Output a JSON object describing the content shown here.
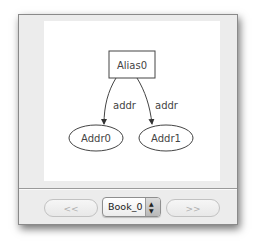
{
  "graph": {
    "nodes": [
      {
        "id": "Alias0",
        "label": "Alias0",
        "shape": "box"
      },
      {
        "id": "Addr0",
        "label": "Addr0",
        "shape": "ellipse"
      },
      {
        "id": "Addr1",
        "label": "Addr1",
        "shape": "ellipse"
      }
    ],
    "edges": [
      {
        "from": "Alias0",
        "to": "Addr0",
        "label": "addr"
      },
      {
        "from": "Alias0",
        "to": "Addr1",
        "label": "addr"
      }
    ]
  },
  "toolbar": {
    "prev_label": "<<",
    "next_label": ">>",
    "selector_value": "Book_0",
    "stepper_up": "▲",
    "stepper_down": "▼"
  },
  "colors": {
    "window_bg": "#ececec",
    "canvas_bg": "#ffffff",
    "stroke": "#333333"
  }
}
